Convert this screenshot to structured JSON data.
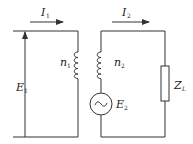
{
  "diagram": {
    "type": "transformer-equivalent-circuit",
    "colors": {
      "line": "#333333",
      "background": "#ffffff"
    },
    "labels": {
      "I1": {
        "main": "I",
        "sub": "1"
      },
      "I2": {
        "main": "I",
        "sub": "2"
      },
      "E1": {
        "main": "E",
        "sub": "1"
      },
      "E2": {
        "main": "E",
        "sub": "2"
      },
      "n1": {
        "main": "n",
        "sub": "1"
      },
      "n2": {
        "main": "n",
        "sub": "2"
      },
      "ZL": {
        "main": "Z",
        "sub": "L"
      }
    },
    "components": [
      {
        "id": "primary-winding",
        "label": "n1"
      },
      {
        "id": "secondary-winding",
        "label": "n2"
      },
      {
        "id": "ac-source",
        "label": "E2",
        "symbol": "~"
      },
      {
        "id": "load-impedance",
        "label": "ZL"
      },
      {
        "id": "primary-voltage-arrow",
        "label": "E1"
      },
      {
        "id": "primary-current-arrow",
        "label": "I1"
      },
      {
        "id": "secondary-current-arrow",
        "label": "I2"
      }
    ]
  }
}
